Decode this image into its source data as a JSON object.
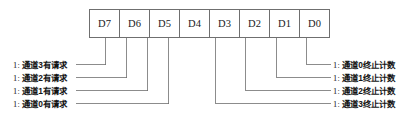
{
  "diagram": {
    "register": {
      "bits": [
        {
          "name": "D7"
        },
        {
          "name": "D6"
        },
        {
          "name": "D5"
        },
        {
          "name": "D4"
        },
        {
          "name": "D3"
        },
        {
          "name": "D2"
        },
        {
          "name": "D1"
        },
        {
          "name": "D0"
        }
      ]
    },
    "left_labels": [
      {
        "prefix": "1:",
        "text": "通道3有请求",
        "bit": "D7"
      },
      {
        "prefix": "1:",
        "text": "通道2有请求",
        "bit": "D6"
      },
      {
        "prefix": "1:",
        "text": "通道1有请求",
        "bit": "D5"
      },
      {
        "prefix": "1:",
        "text": "通道0有请求",
        "bit": "D4"
      }
    ],
    "right_labels": [
      {
        "prefix": "1:",
        "text": "通道0终止计数",
        "bit": "D0"
      },
      {
        "prefix": "1:",
        "text": "通道1终止计数",
        "bit": "D1"
      },
      {
        "prefix": "1:",
        "text": "通道2终止计数",
        "bit": "D2"
      },
      {
        "prefix": "1:",
        "text": "通道3终止计数",
        "bit": "D3"
      }
    ],
    "colors": {
      "line": "#6f6f6f",
      "box_border": "#6f6f6f",
      "background": "#ffffff",
      "text": "#141414"
    }
  }
}
